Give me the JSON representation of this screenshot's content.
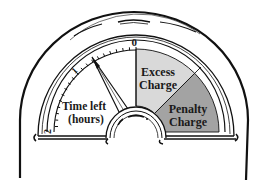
{
  "diagram": {
    "colors": {
      "line": "#111111",
      "face": "#ffffff",
      "excess_fill": "#d9d9d9",
      "penalty_fill": "#a3a3a3"
    },
    "scale": {
      "zero_label": "0",
      "one_label": "1",
      "two_label": "2",
      "unit_label_line1": "Time left",
      "unit_label_line2": "(hours)"
    },
    "zones": [
      {
        "id": "excess",
        "label_line1": "Excess",
        "label_line2": "Charge"
      },
      {
        "id": "penalty",
        "label_line1": "Penalty",
        "label_line2": "Charge"
      }
    ],
    "needle": {
      "reading_hours": 0.7
    }
  }
}
